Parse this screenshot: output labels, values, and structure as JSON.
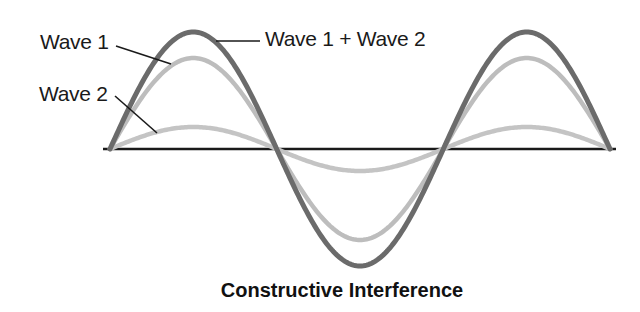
{
  "diagram": {
    "title": "Constructive Interference",
    "labels": {
      "wave1": "Wave 1",
      "wave2": "Wave 2",
      "sum": "Wave 1 + Wave 2"
    },
    "colors": {
      "sum": "#6b6b6b",
      "wave1": "#bdbdbd",
      "wave2": "#c4c4c4",
      "axis": "#1a1a1a",
      "leader": "#1a1a1a"
    },
    "geometry": {
      "baseline_y": 149,
      "axis_x_start": 103,
      "axis_x_end": 616,
      "wave_x_start": 110,
      "wave_x_end": 610,
      "cycles": 1.5,
      "amplitudes": {
        "wave1": 91,
        "wave2": 22,
        "sum": 117
      }
    }
  }
}
